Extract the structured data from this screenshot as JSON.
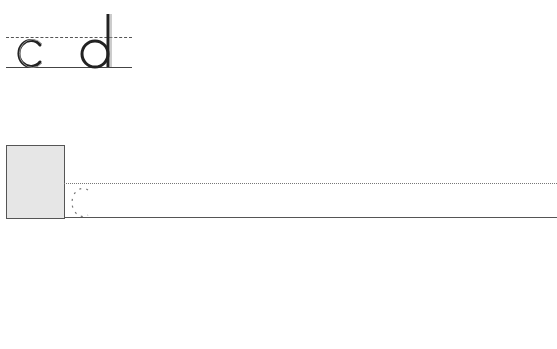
{
  "worksheet": {
    "example_letters": [
      "c",
      "d"
    ],
    "trace_letter": "c",
    "colors": {
      "ink": "#222222",
      "guide_line": "#555555",
      "start_box_fill": "#e6e6e6"
    }
  }
}
